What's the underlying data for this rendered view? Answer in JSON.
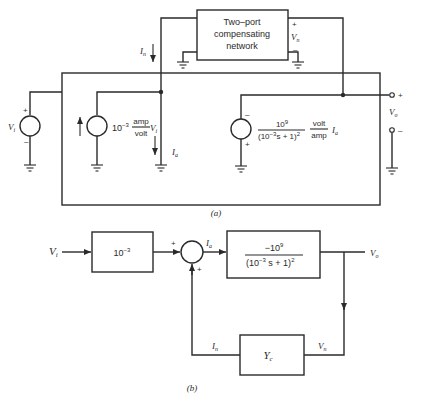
{
  "figure": {
    "part_a": {
      "label": "(a)",
      "compensating_network": {
        "line1": "Two–port",
        "line2": "compensating",
        "line3": "network",
        "vn_label": "V",
        "vn_sub": "n",
        "plus": "+",
        "minus": "–"
      },
      "in_label": "I",
      "in_sub": "n",
      "vi_source": {
        "label": "V",
        "sub": "i",
        "plus": "+",
        "minus": "–"
      },
      "current_source": {
        "coef": "10",
        "coef_exp": "−3",
        "unit_num": "amp",
        "unit_den": "volt",
        "var": "V",
        "var_sub": "i"
      },
      "ia_label": "I",
      "ia_sub": "a",
      "voltage_source": {
        "num": "10",
        "num_exp": "9",
        "den": "(10",
        "den_exp": "−3",
        "den_rest": "s + 1)",
        "den_pow": "2",
        "unit_num": "volt",
        "unit_den": "amp",
        "var": "I",
        "var_sub": "a",
        "minus": "–",
        "plus": "+"
      },
      "vo_terminal": {
        "label": "V",
        "sub": "o",
        "plus": "+",
        "minus": "–"
      }
    },
    "part_b": {
      "label": "(b)",
      "input_label": "V",
      "input_sub": "i",
      "gain_block": {
        "base": "10",
        "exp": "−3"
      },
      "summer": {
        "plus_left": "+",
        "plus_bottom": "+"
      },
      "ia_label": "I",
      "ia_sub": "a",
      "plant_block": {
        "num": "−10",
        "num_exp": "9",
        "den": "(10",
        "den_exp": "−3",
        "den_rest": " s + 1)",
        "den_pow": "2"
      },
      "output_label": "V",
      "output_sub": "o",
      "feedback_block": {
        "label": "Y",
        "sub": "c"
      },
      "vn_label": "V",
      "vn_sub": "n",
      "in_label": "I",
      "in_sub": "n"
    }
  }
}
